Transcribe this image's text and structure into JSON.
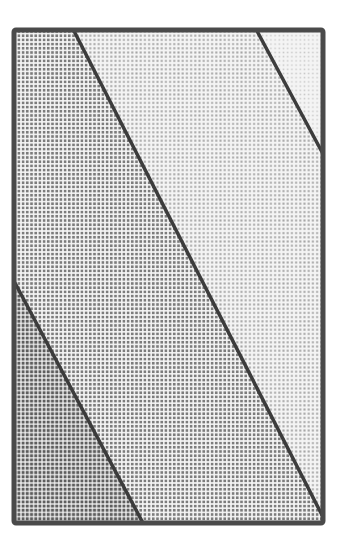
{
  "diagram": {
    "canvas": {
      "width": 345,
      "height": 545
    },
    "frame": {
      "x": 14,
      "y": 30,
      "width": 309,
      "height": 493,
      "stroke": "#4a4a4a",
      "stroke_width": 5
    },
    "divider_lines": [
      {
        "id": "line-1",
        "x1": 15,
        "y1": 283,
        "x2": 143,
        "y2": 523
      },
      {
        "id": "line-2",
        "x1": 74,
        "y1": 31,
        "x2": 322,
        "y2": 515
      },
      {
        "id": "line-3",
        "x1": 257,
        "y1": 31,
        "x2": 322,
        "y2": 152
      }
    ],
    "line_style": {
      "stroke": "#3c3c3c",
      "stroke_width": 3.5
    },
    "regions": [
      {
        "id": "band-darkest",
        "shade": "darkest",
        "points": "14,283 14,523 143,523",
        "fill": "#5e5e5e",
        "dot_gap": 4.2
      },
      {
        "id": "band-dark",
        "shade": "dark",
        "points": "14,30 74,30 323,517 323,523 143,523 14,283",
        "fill": "#7c7c7c",
        "dot_gap": 4.2
      },
      {
        "id": "band-medium",
        "shade": "medium",
        "points": "74,30 257,30 323,154 323,517",
        "fill": "#a6a6a6",
        "dot_gap": 4.2
      },
      {
        "id": "band-light",
        "shade": "light",
        "points": "257,30 323,30 323,154",
        "fill": "#c9c9c9",
        "dot_gap": 4.2
      }
    ]
  }
}
